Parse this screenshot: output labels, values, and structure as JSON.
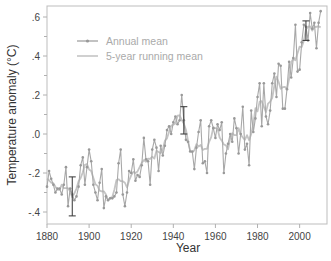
{
  "chart_data": {
    "type": "line",
    "title": "",
    "xlabel": "Year",
    "ylabel": "Temperature anomaly (°C)",
    "xlim": [
      1880,
      2013
    ],
    "ylim": [
      -0.45,
      0.65
    ],
    "x_ticks": [
      1880,
      1900,
      1920,
      1940,
      1960,
      1980,
      2000
    ],
    "x_tick_labels": [
      "1880",
      "1900",
      "1920",
      "1940",
      "1960",
      "1980",
      "2000"
    ],
    "y_ticks": [
      -0.4,
      -0.2,
      0.0,
      0.2,
      0.4,
      0.6
    ],
    "y_tick_labels": [
      "-.4",
      "-.2",
      ".0",
      ".2",
      ".4",
      ".6"
    ],
    "grid": false,
    "legend_position": "upper-left",
    "legend": [
      "Annual mean",
      "5-year running mean"
    ],
    "series": [
      {
        "name": "Annual mean",
        "marker": "dot",
        "x": [
          1880,
          1881,
          1882,
          1883,
          1884,
          1885,
          1886,
          1887,
          1888,
          1889,
          1890,
          1891,
          1892,
          1893,
          1894,
          1895,
          1896,
          1897,
          1898,
          1899,
          1900,
          1901,
          1902,
          1903,
          1904,
          1905,
          1906,
          1907,
          1908,
          1909,
          1910,
          1911,
          1912,
          1913,
          1914,
          1915,
          1916,
          1917,
          1918,
          1919,
          1920,
          1921,
          1922,
          1923,
          1924,
          1925,
          1926,
          1927,
          1928,
          1929,
          1930,
          1931,
          1932,
          1933,
          1934,
          1935,
          1936,
          1937,
          1938,
          1939,
          1940,
          1941,
          1942,
          1943,
          1944,
          1945,
          1946,
          1947,
          1948,
          1949,
          1950,
          1951,
          1952,
          1953,
          1954,
          1955,
          1956,
          1957,
          1958,
          1959,
          1960,
          1961,
          1962,
          1963,
          1964,
          1965,
          1966,
          1967,
          1968,
          1969,
          1970,
          1971,
          1972,
          1973,
          1974,
          1975,
          1976,
          1977,
          1978,
          1979,
          1980,
          1981,
          1982,
          1983,
          1984,
          1985,
          1986,
          1987,
          1988,
          1989,
          1990,
          1991,
          1992,
          1993,
          1994,
          1995,
          1996,
          1997,
          1998,
          1999,
          2000,
          2001,
          2002,
          2003,
          2004,
          2005,
          2006,
          2007,
          2008,
          2009,
          2010
        ],
        "values": [
          -0.27,
          -0.19,
          -0.23,
          -0.26,
          -0.3,
          -0.28,
          -0.28,
          -0.31,
          -0.26,
          -0.17,
          -0.37,
          -0.28,
          -0.31,
          -0.34,
          -0.32,
          -0.27,
          -0.16,
          -0.12,
          -0.26,
          -0.17,
          -0.08,
          -0.14,
          -0.26,
          -0.3,
          -0.34,
          -0.25,
          -0.18,
          -0.38,
          -0.32,
          -0.34,
          -0.33,
          -0.33,
          -0.32,
          -0.3,
          -0.15,
          -0.08,
          -0.31,
          -0.37,
          -0.3,
          -0.19,
          -0.2,
          -0.13,
          -0.24,
          -0.21,
          -0.22,
          -0.16,
          -0.02,
          -0.13,
          -0.14,
          -0.26,
          -0.08,
          -0.03,
          -0.07,
          -0.19,
          -0.06,
          -0.11,
          -0.06,
          0.02,
          0.04,
          0.0,
          0.06,
          0.09,
          0.05,
          0.07,
          0.2,
          0.07,
          -0.03,
          -0.04,
          -0.09,
          -0.09,
          -0.18,
          -0.07,
          0.01,
          0.07,
          -0.15,
          -0.14,
          -0.2,
          0.04,
          0.07,
          0.03,
          -0.02,
          0.05,
          0.02,
          0.06,
          -0.2,
          -0.1,
          -0.05,
          0.0,
          -0.04,
          0.08,
          0.03,
          -0.1,
          0.0,
          0.14,
          -0.08,
          -0.05,
          -0.16,
          0.12,
          0.01,
          0.08,
          0.19,
          0.26,
          0.04,
          0.26,
          0.09,
          0.05,
          0.12,
          0.26,
          0.31,
          0.19,
          0.36,
          0.35,
          0.13,
          0.13,
          0.23,
          0.37,
          0.29,
          0.39,
          0.56,
          0.32,
          0.33,
          0.47,
          0.56,
          0.55,
          0.48,
          0.62,
          0.54,
          0.57,
          0.44,
          0.57,
          0.63
        ]
      },
      {
        "name": "5-year running mean",
        "marker": "none",
        "derived_from": "Annual mean"
      }
    ],
    "error_bars": [
      {
        "x": 1892,
        "low": -0.42,
        "high": -0.22
      },
      {
        "x": 1945,
        "low": 0.0,
        "high": 0.14
      },
      {
        "x": 2003,
        "low": 0.48,
        "high": 0.58
      }
    ]
  },
  "colors": {
    "annual_line": "#a8a8a8",
    "running_line": "#c4c4c4",
    "marker": "#999999",
    "error_bar": "#333333",
    "axis": "#b0b0b0",
    "tick_text": "#444444",
    "legend_text": "#aaaaaa"
  }
}
